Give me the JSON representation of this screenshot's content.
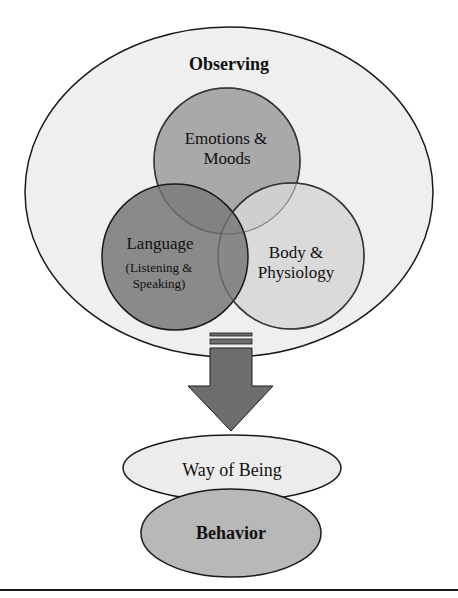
{
  "diagram": {
    "outer": {
      "label": "Observing",
      "fill": "#efefef"
    },
    "circles": [
      {
        "id": "emotions",
        "lines": [
          "Emotions &",
          "Moods"
        ],
        "fill": "#a9a9a9"
      },
      {
        "id": "language",
        "lines": [
          "Language"
        ],
        "sublines": [
          "(Listening &",
          "Speaking)"
        ],
        "fill": "#7c7c7c"
      },
      {
        "id": "body",
        "lines": [
          "Body &",
          "Physiology"
        ],
        "fill": "#d6d6d6"
      }
    ],
    "arrow": {
      "fill": "#6e6e6e",
      "direction": "down"
    },
    "outcomes": [
      {
        "id": "way-of-being",
        "label": "Way of Being",
        "fill": "#ececec"
      },
      {
        "id": "behavior",
        "label": "Behavior",
        "fill": "#b8b8b8"
      }
    ],
    "stroke": "#1a1a1a"
  }
}
